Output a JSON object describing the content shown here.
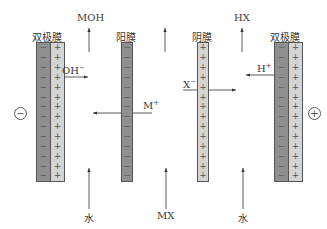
{
  "membranes": [
    {
      "id": "bipolar-left",
      "label": "双极膜",
      "type": "bipolar",
      "left_signs": "−",
      "right_signs": "+"
    },
    {
      "id": "cation",
      "label": "阳膜",
      "type": "cation",
      "signs": "−"
    },
    {
      "id": "anion",
      "label": "阴膜",
      "type": "anion",
      "signs": "+"
    },
    {
      "id": "bipolar-right",
      "label": "双极膜",
      "type": "bipolar",
      "left_signs": "−",
      "right_signs": "+"
    }
  ],
  "electrodes": {
    "cathode": "−",
    "anode": "+"
  },
  "products": {
    "base": "MOH",
    "acid": "HX"
  },
  "inputs": {
    "left": "水",
    "middle": "MX",
    "right": "水"
  },
  "ions": {
    "hydroxide": {
      "base": "OH",
      "charge": "−"
    },
    "cation": {
      "base": "M",
      "charge": "+"
    },
    "anion": {
      "base": "X",
      "charge": "−"
    },
    "proton": {
      "base": "H",
      "charge": "+"
    }
  },
  "colors": {
    "dark_membrane": "#8f8f8f",
    "light_membrane": "#d4d4d4",
    "line": "#333333"
  }
}
